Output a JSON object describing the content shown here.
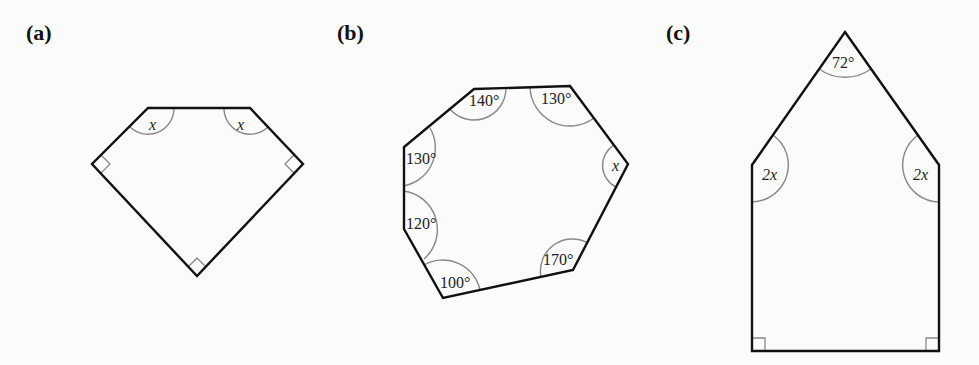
{
  "figures": [
    {
      "id": "a",
      "label": "(a)",
      "label_pos": [
        26,
        38
      ],
      "vertices": [
        [
          148,
          108
        ],
        [
          250,
          108
        ],
        [
          303,
          164
        ],
        [
          197,
          276
        ],
        [
          92,
          164
        ]
      ],
      "arcs": [
        {
          "d": "M 174 108 A 26 26 0 0 1 130 127"
        },
        {
          "d": "M 224 108 A 26 26 0 0 0 268 127"
        }
      ],
      "right_angles": [
        {
          "d": "M 101 155 L 110 164 L 101 173"
        },
        {
          "d": "M 294 155 L 285 164 L 294 173"
        },
        {
          "d": "M 188 267 L 197 258 L 206 267"
        }
      ],
      "angle_labels": [
        {
          "text": "x",
          "pos": [
            149,
            130
          ],
          "italic": true
        },
        {
          "text": "x",
          "pos": [
            237,
            130
          ],
          "italic": true
        }
      ]
    },
    {
      "id": "b",
      "label": "(b)",
      "label_pos": [
        337,
        38
      ],
      "vertices": [
        [
          474,
          89
        ],
        [
          570,
          86
        ],
        [
          628,
          164
        ],
        [
          573,
          270
        ],
        [
          443,
          298
        ],
        [
          404,
          229
        ],
        [
          404,
          147
        ]
      ],
      "arcs": [
        {
          "d": "M 506 88 A 32 32 0 0 1 449 108"
        },
        {
          "d": "M 530 87 A 40 40 0 0 0 594 118"
        },
        {
          "d": "M 614 145 A 24 24 0 0 0 616 187"
        },
        {
          "d": "M 588 243 A 32 32 0 0 0 541 277"
        },
        {
          "d": "M 480 290 A 38 38 0 0 0 424 265"
        },
        {
          "d": "M 404 191 A 39 39 0 0 1 424 259"
        },
        {
          "d": "M 404 186 A 39 39 0 0 0 430 128"
        }
      ],
      "right_angles": [],
      "angle_labels": [
        {
          "text": "140°",
          "pos": [
            469,
            106
          ],
          "italic": false
        },
        {
          "text": "130°",
          "pos": [
            541,
            104
          ],
          "italic": false
        },
        {
          "text": "x",
          "pos": [
            612,
            171
          ],
          "italic": true
        },
        {
          "text": "130°",
          "pos": [
            406,
            164
          ],
          "italic": false
        },
        {
          "text": "120°",
          "pos": [
            406,
            229
          ],
          "italic": false
        },
        {
          "text": "170°",
          "pos": [
            543,
            265
          ],
          "italic": false
        },
        {
          "text": "100°",
          "pos": [
            440,
            288
          ],
          "italic": false
        }
      ]
    },
    {
      "id": "c",
      "label": "(c)",
      "label_pos": [
        666,
        38
      ],
      "vertices": [
        [
          845,
          32
        ],
        [
          939,
          165
        ],
        [
          939,
          351
        ],
        [
          752,
          351
        ],
        [
          752,
          165
        ]
      ],
      "arcs": [
        {
          "d": "M 819 69 A 45 45 0 0 0 871 69"
        },
        {
          "d": "M 773 135 A 37 37 0 0 1 752 202"
        },
        {
          "d": "M 918 135 A 37 37 0 0 0 939 202"
        }
      ],
      "right_angles": [
        {
          "d": "M 752 338 L 765 338 L 765 351"
        },
        {
          "d": "M 939 338 L 926 338 L 926 351"
        }
      ],
      "angle_labels": [
        {
          "text": "72°",
          "pos": [
            832,
            68
          ],
          "italic": false
        },
        {
          "text": "2x",
          "pos": [
            762,
            180
          ],
          "italic": true
        },
        {
          "text": "2x",
          "pos": [
            913,
            180
          ],
          "italic": true
        }
      ]
    }
  ]
}
